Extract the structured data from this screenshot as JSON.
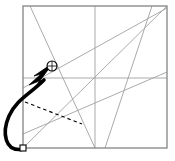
{
  "figure": {
    "canvas": {
      "width": 175,
      "height": 161,
      "background": "#ffffff"
    },
    "colors": {
      "paper_border": "#8c8c8c",
      "crease_line": "#a0a0a0",
      "drag_path": "#000000",
      "dashed_guide": "#000000",
      "marker_fill": "#ffffff",
      "marker_stroke": "#000000"
    },
    "paper": {
      "label": "square-sheet",
      "x1": 23,
      "y1": 6,
      "x2": 167,
      "y2": 148,
      "stroke_width": 1.4
    },
    "creases": [
      {
        "name": "horizontal-midline",
        "x1": 23,
        "y1": 78,
        "x2": 167,
        "y2": 78
      },
      {
        "name": "vertical-midline",
        "x1": 95,
        "y1": 6,
        "x2": 95,
        "y2": 148
      },
      {
        "name": "main-diagonal",
        "x1": 23,
        "y1": 148,
        "x2": 167,
        "y2": 6
      },
      {
        "name": "left-fold-crease",
        "x1": 30,
        "y1": 6,
        "x2": 95,
        "y2": 148
      },
      {
        "name": "right-fold-crease",
        "x1": 152,
        "y1": 6,
        "x2": 105,
        "y2": 148
      },
      {
        "name": "low-rising-crease",
        "x1": 23,
        "y1": 134,
        "x2": 167,
        "y2": 72
      },
      {
        "name": "upper-shallow-crease",
        "x1": 23,
        "y1": 88,
        "x2": 167,
        "y2": 8
      }
    ],
    "guide": {
      "name": "dashed-drag-chord",
      "x1": 25,
      "y1": 102,
      "x2": 82,
      "y2": 124,
      "dash_pattern": "3.5,3"
    },
    "drag_path": {
      "name": "curved-drag-arrow",
      "d": "M 24 149 C 4 153 2 132 9 116 C 16 100 30 94 44 80",
      "stroke_width": 3.6,
      "arrow_tip": {
        "x": 52,
        "y": 68
      },
      "arrow_size": 13
    },
    "markers": [
      {
        "name": "source-point-marker",
        "shape": "square",
        "x": 23,
        "y": 148,
        "size": 6
      },
      {
        "name": "target-point-marker",
        "shape": "circle",
        "x": 52,
        "y": 66,
        "radius": 5
      }
    ]
  }
}
